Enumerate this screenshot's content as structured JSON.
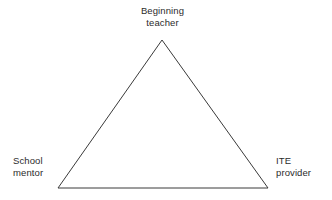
{
  "diagram": {
    "type": "triangle-relationship-diagram",
    "background_color": "#ffffff",
    "stroke_color": "#3a3a3a",
    "text_color": "#2b2b2b",
    "nodes": [
      {
        "id": "beginning-teacher",
        "label": "Beginning\nteacher",
        "position": "top-apex"
      },
      {
        "id": "school-mentor",
        "label": "School\nmentor",
        "position": "bottom-left"
      },
      {
        "id": "ite-provider",
        "label": "ITE\nprovider",
        "position": "bottom-right"
      }
    ],
    "vertices": {
      "apex": [
        162,
        40
      ],
      "bottom_left": [
        58,
        188
      ],
      "bottom_right": [
        268,
        188
      ]
    }
  }
}
